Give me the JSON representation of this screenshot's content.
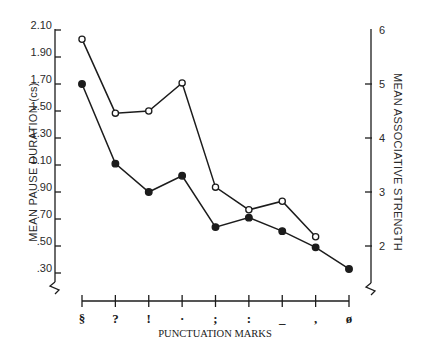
{
  "chart_data": {
    "type": "line",
    "title": "",
    "xlabel": "PUNCTUATION MARKS",
    "ylabel": "MEAN PAUSE DURATION (cs)",
    "y2label": "MEAN ASSOCIATIVE STRENGTH",
    "categories": [
      "§",
      "?",
      "!",
      "·",
      ";",
      ":",
      "_",
      ",",
      "ø"
    ],
    "y_ticks": [
      "2.10",
      "1.90",
      "1.70",
      "1.50",
      "1.30",
      "1.10",
      ".90",
      ".70",
      ".50",
      ".30"
    ],
    "y2_ticks": [
      "6",
      "5",
      "4",
      "3",
      "2"
    ],
    "ylim": [
      0.3,
      2.1
    ],
    "y2lim": [
      2,
      6
    ],
    "grid": false,
    "legend": "none",
    "series": [
      {
        "name": "Mean pause duration (cs)",
        "axis": "left",
        "marker": "filled-circle",
        "values": [
          1.7,
          1.11,
          0.9,
          1.02,
          0.64,
          0.71,
          0.61,
          0.49,
          0.33
        ]
      },
      {
        "name": "Mean associative strength",
        "axis": "right",
        "marker": "open-circle",
        "values": [
          5.83,
          4.46,
          4.5,
          5.02,
          3.09,
          2.67,
          2.83,
          2.17,
          null
        ]
      }
    ]
  },
  "labels": {
    "xlabel": "PUNCTUATION MARKS",
    "ylabel": "MEAN PAUSE DURATION (cs)",
    "y2label": "MEAN ASSOCIATIVE STRENGTH"
  }
}
